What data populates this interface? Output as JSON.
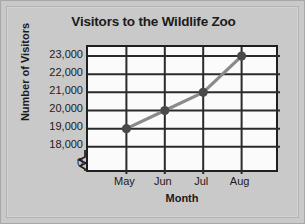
{
  "chart_data": {
    "type": "line",
    "title": "Visitors to the Wildlife Zoo",
    "xlabel": "Month",
    "ylabel": "Number of Visitors",
    "categories": [
      "May",
      "Jun",
      "Jul",
      "Aug"
    ],
    "values": [
      19000,
      20000,
      21000,
      23000
    ],
    "value_labels": [
      "19,000",
      "20,000",
      "21,000",
      "23,000"
    ],
    "ytick_labels": [
      "23,000",
      "22,000",
      "21,000",
      "20,000",
      "19,000",
      "18,000",
      "0"
    ],
    "ytick_values": [
      23000,
      22000,
      21000,
      20000,
      19000,
      18000,
      0
    ],
    "ylim": [
      18000,
      23500
    ],
    "y_axis_break": true,
    "y_axis_break_symbol": "zigzag",
    "grid": true,
    "legend": "none",
    "series": [
      {
        "name": "Visitors",
        "values": [
          19000,
          20000,
          21000,
          23000
        ]
      }
    ],
    "colors": {
      "line": "#8a8a8a",
      "marker": "#4a4a4a",
      "grid": "#2b2b2b",
      "axis": "#1f1f1f",
      "plot_background": "#fbfbfb",
      "page_background": "#c9c9c9",
      "text": "#1b1b1b"
    }
  }
}
